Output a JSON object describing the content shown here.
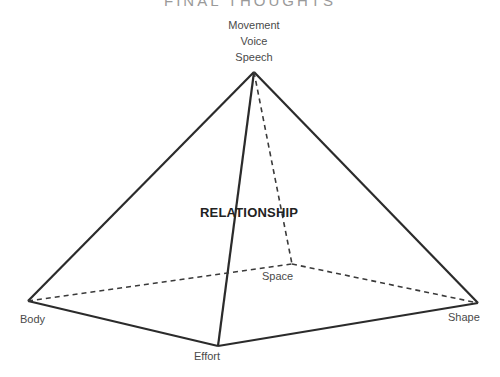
{
  "title": "FINAL THOUGHTS",
  "diagram": {
    "apex_labels": [
      "Movement",
      "Voice",
      "Speech"
    ],
    "center_label": "RELATIONSHIP",
    "vertices": {
      "body": "Body",
      "effort": "Effort",
      "shape": "Shape",
      "space": "Space"
    }
  }
}
